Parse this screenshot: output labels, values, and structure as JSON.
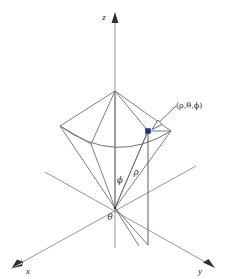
{
  "figure": {
    "background_color": "#ffffff",
    "axis_color": "#8a8a8a",
    "point_color": "#26306e",
    "label_color": "#1d1d20"
  },
  "axes": [
    {
      "name": "z",
      "label": "z",
      "direction": "up"
    },
    {
      "name": "x",
      "label": "x",
      "direction": "down-left"
    },
    {
      "name": "y",
      "label": "y",
      "direction": "down-right"
    }
  ],
  "labels": {
    "z_axis": "z",
    "x_axis": "x",
    "y_axis": "y",
    "theta": "θ",
    "phi": "ϕ",
    "rho": "ρ",
    "point": "(ρ,θ,ϕ)"
  },
  "annotations": {
    "origin_label": "θ",
    "polar_angle_label": "ϕ",
    "radius_label": "ρ",
    "point_coordinates_label": "(ρ,θ,ϕ)"
  },
  "geometry": {
    "origin": {
      "x": 115,
      "y": 208
    },
    "point": {
      "x": 148,
      "y": 131
    },
    "cone_apex": {
      "x": 115,
      "y": 91
    },
    "rim_left": {
      "x": 60,
      "y": 126
    },
    "rim_right": {
      "x": 171,
      "y": 131
    },
    "drop_foot": {
      "x": 148,
      "y": 245
    }
  }
}
